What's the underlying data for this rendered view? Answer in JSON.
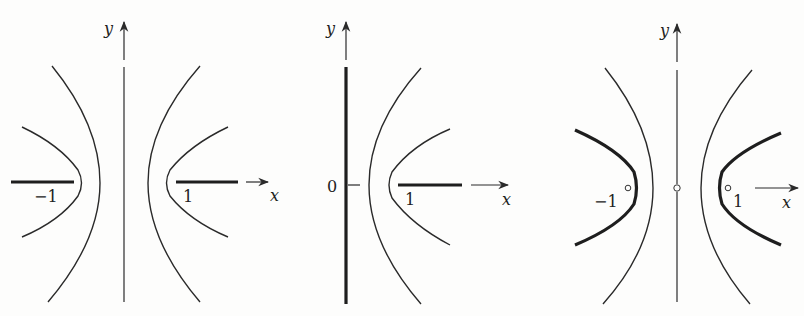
{
  "figure": {
    "panels": [
      {
        "id": "panel-1",
        "axis_labels": {
          "x": "x",
          "y": "y"
        },
        "tick_labels": {
          "neg_one": "−1",
          "one": "1"
        },
        "description": "Two families of confocal hyperbolas about y-axis; thick cuts on real axis from -∞ to -1 and 1 to ∞"
      },
      {
        "id": "panel-2",
        "axis_labels": {
          "x": "x",
          "y": "y"
        },
        "tick_labels": {
          "zero": "0",
          "one": "1"
        },
        "description": "Right half-plane; thick y-axis and thick cut from 1 to ∞"
      },
      {
        "id": "panel-3",
        "axis_labels": {
          "x": "x",
          "y": "y"
        },
        "tick_labels": {
          "neg_one": "−1",
          "one": "1"
        },
        "description": "Thin outer hyperbolas and thick inner hyperbola branches; small open circles at -1, 0 and 1"
      }
    ]
  }
}
